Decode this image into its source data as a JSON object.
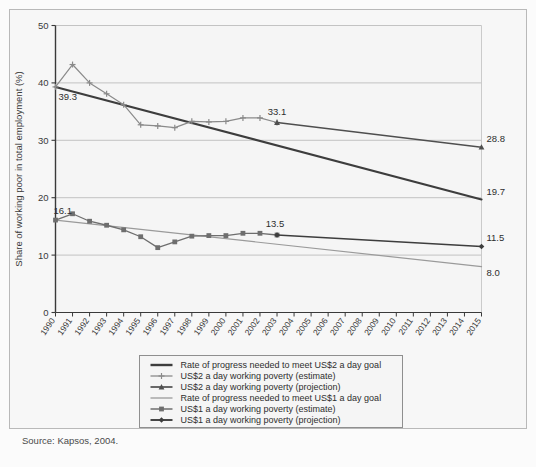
{
  "figure": {
    "source_note": "Source: Kapsos, 2004."
  },
  "chart_data": {
    "type": "line",
    "title": "",
    "xlabel": "",
    "ylabel": "Share of working poor in total employment (%)",
    "xlim": [
      1990,
      2015
    ],
    "ylim": [
      0,
      50
    ],
    "yticks": [
      0,
      10,
      20,
      30,
      40,
      50
    ],
    "ytick_labels": [
      "0",
      "10",
      "20",
      "30",
      "40",
      "50"
    ],
    "grid": "horizontal",
    "legend_position": "below-axes",
    "x": [
      1990,
      1991,
      1992,
      1993,
      1994,
      1995,
      1996,
      1997,
      1998,
      1999,
      2000,
      2001,
      2002,
      2003,
      2004,
      2005,
      2006,
      2007,
      2008,
      2009,
      2010,
      2011,
      2012,
      2013,
      2014,
      2015
    ],
    "xtick_labels": [
      "1990",
      "1991",
      "1992",
      "1993",
      "1994",
      "1995",
      "1996",
      "1997",
      "1998",
      "1999",
      "2000",
      "2001",
      "2002",
      "2003",
      "2004",
      "2005",
      "2006",
      "2007",
      "2008",
      "2009",
      "2010",
      "2011",
      "2012",
      "2013",
      "2014",
      "2015"
    ],
    "series": [
      {
        "name": "Rate of progress needed to meet US$2 a day goal",
        "key": "us2_goal",
        "marker": "none",
        "color": "#3d3d3d",
        "width": 2.1,
        "x": [
          1990,
          2015
        ],
        "values": [
          39.3,
          19.7
        ]
      },
      {
        "name": "US$2 a day working poverty (estimate)",
        "key": "us2_estimate",
        "marker": "cross",
        "color": "#8a8a8a",
        "width": 1.2,
        "x": [
          1990,
          1991,
          1992,
          1993,
          1994,
          1995,
          1996,
          1997,
          1998,
          1999,
          2000,
          2001,
          2002,
          2003
        ],
        "values": [
          39.3,
          43.2,
          40.0,
          38.1,
          36.2,
          32.7,
          32.5,
          32.2,
          33.3,
          33.2,
          33.3,
          33.9,
          33.9,
          33.1
        ]
      },
      {
        "name": "US$2 a day working poverty (projection)",
        "key": "us2_projection",
        "marker": "triangle",
        "color": "#4f4f4f",
        "width": 1.6,
        "x": [
          2003,
          2015
        ],
        "values": [
          33.1,
          28.8
        ]
      },
      {
        "name": "Rate of progress needed to meet US$1 a day goal",
        "key": "us1_goal",
        "marker": "none",
        "color": "#9a9a9a",
        "width": 1.2,
        "x": [
          1990,
          2015
        ],
        "values": [
          16.1,
          8.0
        ]
      },
      {
        "name": "US$1 a day working poverty (estimate)",
        "key": "us1_estimate",
        "marker": "square",
        "color": "#6e6e6e",
        "width": 1.3,
        "x": [
          1990,
          1991,
          1992,
          1993,
          1994,
          1995,
          1996,
          1997,
          1998,
          1999,
          2000,
          2001,
          2002,
          2003
        ],
        "values": [
          16.1,
          17.2,
          15.9,
          15.2,
          14.4,
          13.2,
          11.3,
          12.3,
          13.3,
          13.4,
          13.4,
          13.8,
          13.8,
          13.5
        ]
      },
      {
        "name": "US$1 a day working poverty (projection)",
        "key": "us1_projection",
        "marker": "diamond",
        "color": "#3d3d3d",
        "width": 1.7,
        "x": [
          2003,
          2015
        ],
        "values": [
          13.5,
          11.5
        ]
      }
    ],
    "annotations": [
      {
        "key": "a1",
        "text": "39.3",
        "x": 1990,
        "y": 39.3,
        "anchor": "start",
        "dx": 3,
        "dy": 13
      },
      {
        "key": "a2",
        "text": "33.1",
        "x": 2003,
        "y": 33.1,
        "anchor": "middle",
        "dx": 0,
        "dy": -8
      },
      {
        "key": "a3",
        "text": "16.1",
        "x": 1990,
        "y": 16.1,
        "anchor": "start",
        "dx": -2,
        "dy": -6
      },
      {
        "key": "a4",
        "text": "13.5",
        "x": 2003,
        "y": 13.5,
        "anchor": "middle",
        "dx": -2,
        "dy": -8
      },
      {
        "key": "a5",
        "text": "28.8",
        "x": 2015,
        "y": 28.8,
        "anchor": "start",
        "dx": 5,
        "dy": -5
      },
      {
        "key": "a6",
        "text": "19.7",
        "x": 2015,
        "y": 19.7,
        "anchor": "start",
        "dx": 5,
        "dy": -4
      },
      {
        "key": "a7",
        "text": "11.5",
        "x": 2015,
        "y": 11.5,
        "anchor": "start",
        "dx": 5,
        "dy": -5
      },
      {
        "key": "a8",
        "text": "8.0",
        "x": 2015,
        "y": 8.0,
        "anchor": "start",
        "dx": 5,
        "dy": 9
      }
    ],
    "legend_items": [
      {
        "label": "Rate of progress needed to meet US$2 a day goal",
        "marker": "none",
        "color": "#3d3d3d",
        "width": 2.4
      },
      {
        "label": "US$2 a day working poverty (estimate)",
        "marker": "cross",
        "color": "#8a8a8a",
        "width": 1.3
      },
      {
        "label": "US$2 a day working poverty (projection)",
        "marker": "triangle",
        "color": "#4f4f4f",
        "width": 1.7
      },
      {
        "label": "Rate of progress needed to meet US$1 a day goal",
        "marker": "none",
        "color": "#9a9a9a",
        "width": 1.3
      },
      {
        "label": "US$1 a day working poverty (estimate)",
        "marker": "square",
        "color": "#6e6e6e",
        "width": 1.5
      },
      {
        "label": "US$1 a day working poverty (projection)",
        "marker": "diamond",
        "color": "#3d3d3d",
        "width": 1.9
      }
    ]
  }
}
